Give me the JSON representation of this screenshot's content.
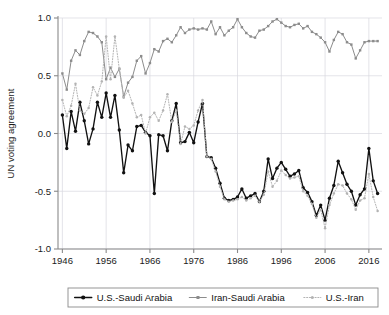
{
  "chart_data": {
    "type": "line",
    "title": "",
    "xlabel": "",
    "ylabel": "UN voting agreement",
    "xlim": [
      1945,
      2019
    ],
    "ylim": [
      -1.0,
      1.0
    ],
    "grid": true,
    "legend_position": "bottom",
    "x_ticks": [
      "1946",
      "1956",
      "1966",
      "1976",
      "1986",
      "1996",
      "2006",
      "2016"
    ],
    "x_tick_values": [
      1946,
      1956,
      1966,
      1976,
      1986,
      1996,
      2006,
      2016
    ],
    "y_ticks": [
      "1.0",
      "0.5",
      "0.0",
      "-0.5",
      "-1.0"
    ],
    "y_tick_values": [
      1.0,
      0.5,
      0.0,
      -0.5,
      -1.0
    ],
    "x": [
      1946,
      1947,
      1948,
      1949,
      1950,
      1951,
      1952,
      1953,
      1954,
      1955,
      1956,
      1957,
      1958,
      1959,
      1960,
      1961,
      1962,
      1963,
      1964,
      1965,
      1966,
      1967,
      1968,
      1969,
      1970,
      1971,
      1972,
      1973,
      1974,
      1975,
      1976,
      1977,
      1978,
      1979,
      1980,
      1981,
      1982,
      1983,
      1984,
      1985,
      1986,
      1987,
      1988,
      1989,
      1990,
      1991,
      1992,
      1993,
      1994,
      1995,
      1996,
      1997,
      1998,
      1999,
      2000,
      2001,
      2002,
      2003,
      2004,
      2005,
      2006,
      2007,
      2008,
      2009,
      2010,
      2011,
      2012,
      2013,
      2014,
      2015,
      2016,
      2017,
      2018
    ],
    "series": [
      {
        "name": "U.S.-Saudi Arabia",
        "color": "#111111",
        "linestyle": "solid",
        "marker": "circle",
        "values": [
          0.16,
          -0.13,
          0.19,
          0.02,
          0.27,
          0.11,
          -0.09,
          0.04,
          0.27,
          0.14,
          0.35,
          0.14,
          0.33,
          0.03,
          -0.34,
          -0.1,
          -0.15,
          0.06,
          0.07,
          0.01,
          -0.02,
          -0.52,
          -0.01,
          -0.02,
          -0.15,
          0.11,
          0.26,
          -0.08,
          -0.07,
          0.01,
          -0.08,
          0.1,
          0.26,
          -0.2,
          -0.21,
          -0.3,
          -0.43,
          -0.56,
          -0.58,
          -0.57,
          -0.55,
          -0.48,
          -0.56,
          -0.54,
          -0.52,
          -0.59,
          -0.5,
          -0.22,
          -0.39,
          -0.3,
          -0.25,
          -0.31,
          -0.37,
          -0.35,
          -0.32,
          -0.47,
          -0.51,
          -0.59,
          -0.71,
          -0.62,
          -0.75,
          -0.56,
          -0.45,
          -0.24,
          -0.34,
          -0.44,
          -0.5,
          -0.62,
          -0.53,
          -0.48,
          -0.13,
          -0.41,
          -0.52
        ]
      },
      {
        "name": "Iran-Saudi Arabia",
        "color": "#8c8c8c",
        "linestyle": "solid",
        "marker": "square",
        "values": [
          0.52,
          0.38,
          0.63,
          0.72,
          0.68,
          0.8,
          0.88,
          0.87,
          0.84,
          0.79,
          0.47,
          0.57,
          0.49,
          0.56,
          0.32,
          0.44,
          0.49,
          0.63,
          0.67,
          0.52,
          0.61,
          0.73,
          0.71,
          0.8,
          0.82,
          0.79,
          0.85,
          0.92,
          0.87,
          0.9,
          0.91,
          0.9,
          0.91,
          0.9,
          0.97,
          0.86,
          0.92,
          0.85,
          0.89,
          0.92,
          0.99,
          0.92,
          0.87,
          0.84,
          0.83,
          0.89,
          0.9,
          0.93,
          0.97,
          0.99,
          0.96,
          0.93,
          0.92,
          0.94,
          0.95,
          0.91,
          0.93,
          0.88,
          0.86,
          0.83,
          0.79,
          0.71,
          0.81,
          0.88,
          0.86,
          0.79,
          0.77,
          0.65,
          0.72,
          0.79,
          0.8,
          0.8,
          0.8
        ]
      },
      {
        "name": "U.S.-Iran",
        "color": "#b3b3b3",
        "linestyle": "dotted",
        "marker": "circle-small",
        "values": [
          0.29,
          0.15,
          0.24,
          0.43,
          0.2,
          0.17,
          0.22,
          0.4,
          0.33,
          0.45,
          0.84,
          0.47,
          0.84,
          0.56,
          0.31,
          0.37,
          0.26,
          0.14,
          0.16,
          0.0,
          0.14,
          0.18,
          0.11,
          0.2,
          0.34,
          0.1,
          0.2,
          -0.09,
          0.06,
          0.04,
          0.07,
          0.2,
          0.29,
          -0.2,
          -0.22,
          -0.33,
          -0.46,
          -0.57,
          -0.59,
          -0.58,
          -0.57,
          -0.55,
          -0.58,
          -0.56,
          -0.54,
          -0.59,
          -0.53,
          -0.33,
          -0.46,
          -0.41,
          -0.32,
          -0.36,
          -0.39,
          -0.38,
          -0.37,
          -0.5,
          -0.54,
          -0.61,
          -0.73,
          -0.66,
          -0.82,
          -0.62,
          -0.52,
          -0.44,
          -0.45,
          -0.52,
          -0.57,
          -0.66,
          -0.58,
          -0.56,
          -0.35,
          -0.55,
          -0.67
        ]
      }
    ]
  },
  "legend": {
    "items": [
      {
        "label": "U.S.-Saudi Arabia",
        "color": "#111111",
        "style": "solid"
      },
      {
        "label": "Iran-Saudi Arabia",
        "color": "#8c8c8c",
        "style": "solid"
      },
      {
        "label": "U.S.-Iran",
        "color": "#b3b3b3",
        "style": "dotted"
      }
    ]
  }
}
